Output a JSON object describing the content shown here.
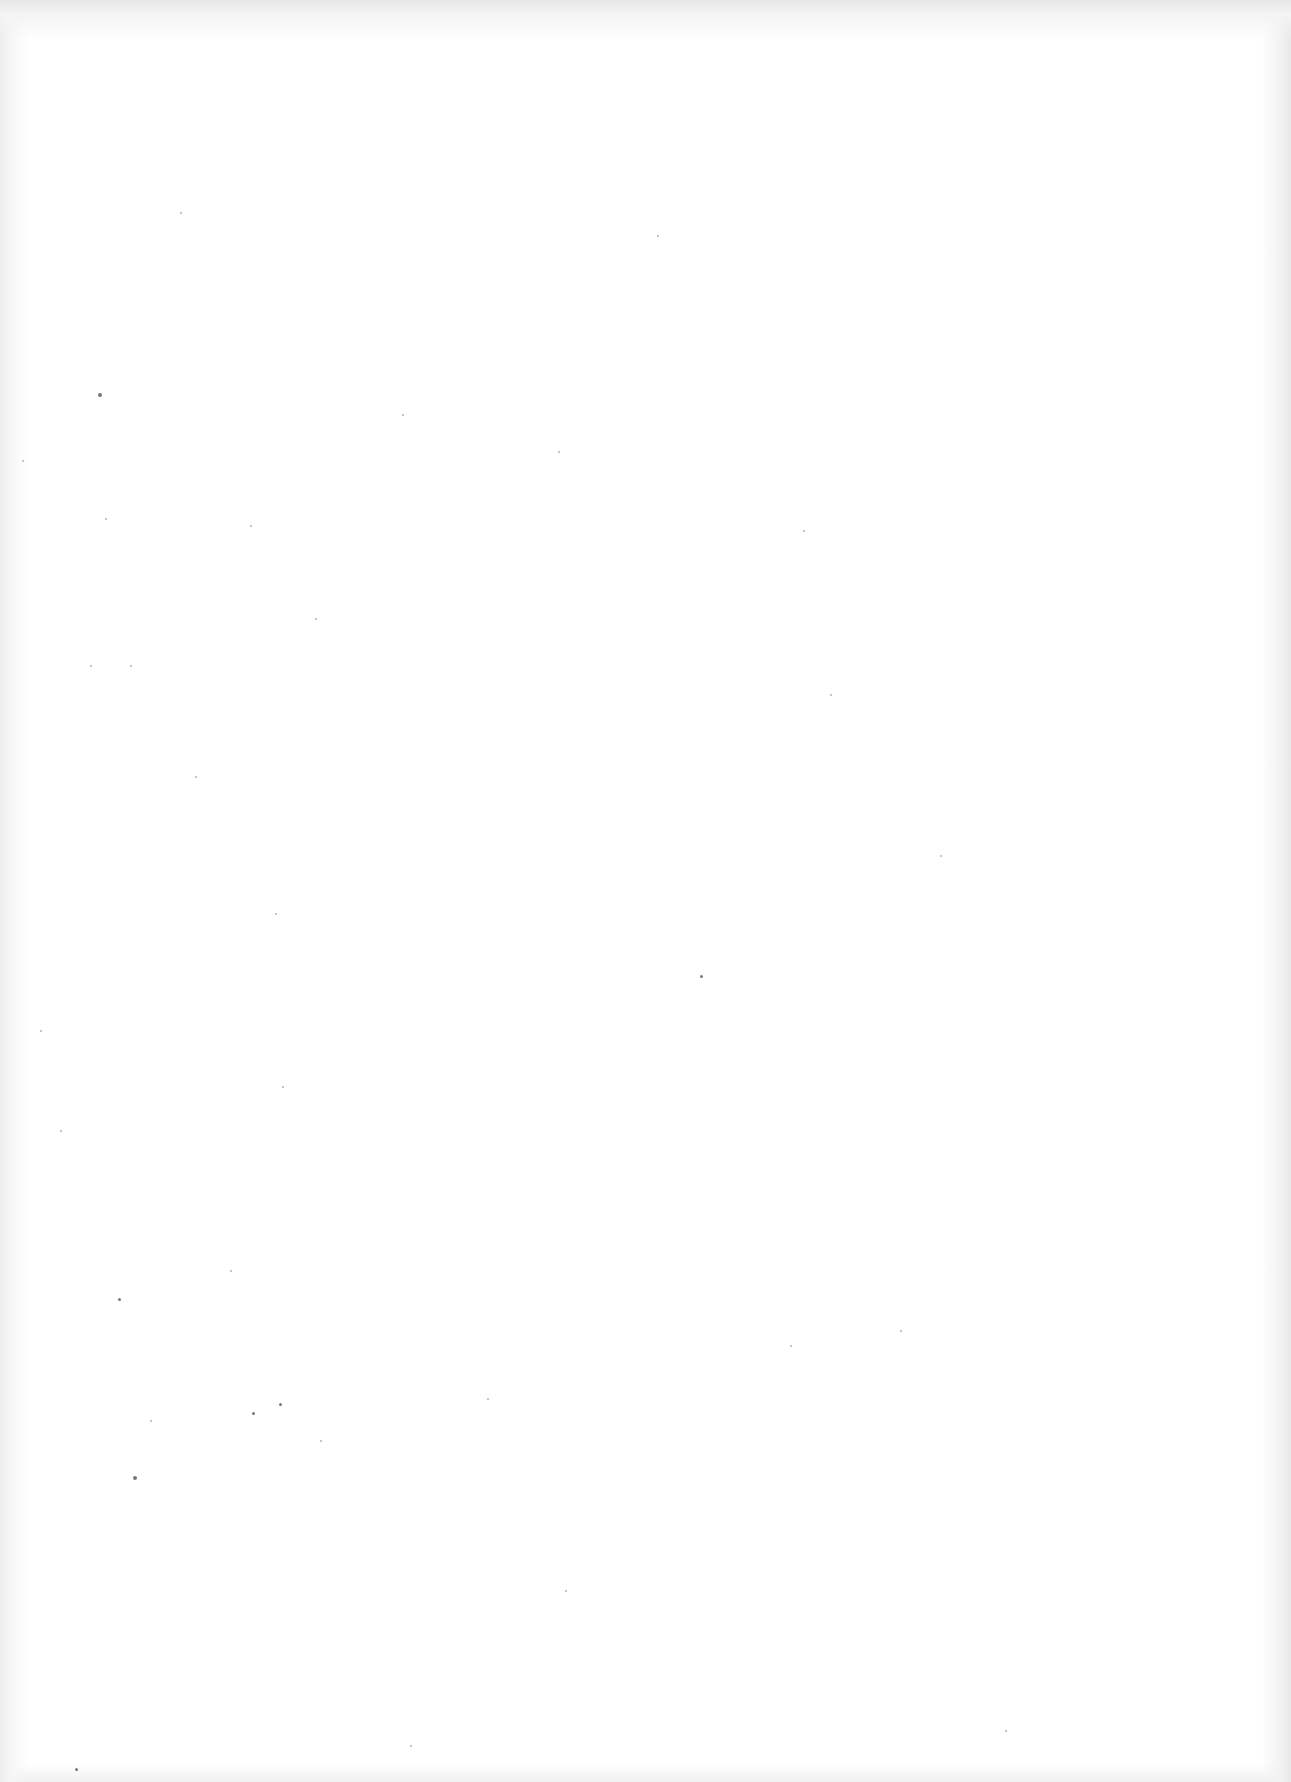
{
  "document": {
    "type": "scanned-page",
    "content_text": "",
    "blank": true
  },
  "colors": {
    "paper": "#ffffff",
    "scan_edge": "#e8e8e8",
    "speck": "#555555"
  },
  "specks": [
    [
      98,
      393,
      4
    ],
    [
      657,
      235,
      2
    ],
    [
      803,
      530,
      2
    ],
    [
      830,
      694,
      2
    ],
    [
      700,
      975,
      3
    ],
    [
      118,
      1298,
      3
    ],
    [
      252,
      1412,
      3
    ],
    [
      487,
      1398,
      2
    ],
    [
      68,
      1800,
      2
    ],
    [
      133,
      1476,
      4
    ],
    [
      279,
      1403,
      3
    ],
    [
      180,
      212,
      2
    ],
    [
      402,
      414,
      2
    ],
    [
      558,
      451,
      2
    ],
    [
      275,
      913,
      2
    ],
    [
      282,
      1086,
      2
    ],
    [
      195,
      776,
      2
    ],
    [
      90,
      665,
      2
    ],
    [
      230,
      1270,
      2
    ],
    [
      75,
      1768,
      3
    ],
    [
      250,
      525,
      2
    ],
    [
      105,
      518,
      2
    ],
    [
      315,
      618,
      2
    ],
    [
      940,
      855,
      2
    ],
    [
      790,
      1345,
      2
    ],
    [
      40,
      1030,
      2
    ],
    [
      60,
      1130,
      2
    ],
    [
      150,
      1420,
      2
    ],
    [
      320,
      1440,
      2
    ],
    [
      565,
      1590,
      2
    ],
    [
      900,
      1330,
      2
    ],
    [
      1005,
      1730,
      2
    ],
    [
      410,
      1745,
      2
    ],
    [
      22,
      460,
      2
    ],
    [
      130,
      665,
      2
    ]
  ]
}
